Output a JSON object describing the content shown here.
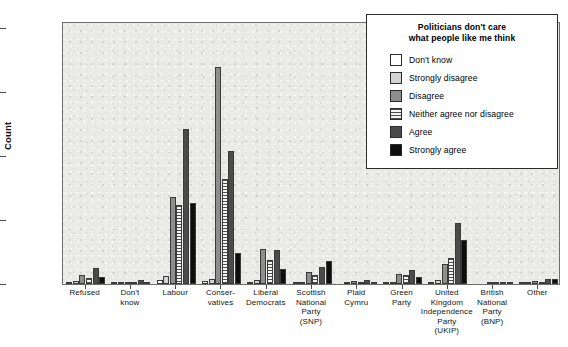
{
  "chart_data": {
    "type": "bar",
    "title": "",
    "xlabel": "",
    "ylabel": "Count",
    "ylim": [
      0,
      430
    ],
    "yticks": [
      0,
      100,
      200,
      300,
      400
    ],
    "grid": false,
    "legend_position": "top-right",
    "legend_title": "Politicians don't care what people like me think",
    "categories": [
      "Refused",
      "Don't know",
      "Labour",
      "Conservatives",
      "Liberal Democrats",
      "Scottish National Party (SNP)",
      "Plaid Cymru",
      "Green Party",
      "United Kingdom Independence Party (UKIP)",
      "British National Party (BNP)",
      "Other"
    ],
    "series": [
      {
        "name": "Don't know",
        "color": "#ffffff",
        "values": [
          4,
          1,
          7,
          5,
          2,
          1,
          0,
          1,
          3,
          0,
          1
        ]
      },
      {
        "name": "Strongly disagree",
        "color": "#d2d2d2",
        "values": [
          5,
          2,
          13,
          9,
          6,
          3,
          1,
          3,
          6,
          0,
          2
        ]
      },
      {
        "name": "Disagree",
        "color": "#8e8e8e",
        "values": [
          15,
          4,
          143,
          355,
          57,
          19,
          5,
          17,
          33,
          1,
          5
        ]
      },
      {
        "name": "Neither agree nor disagree",
        "color": "#f2f2f2",
        "values": [
          10,
          3,
          130,
          172,
          40,
          14,
          4,
          14,
          42,
          1,
          4
        ]
      },
      {
        "name": "Agree",
        "color": "#4b4b4b",
        "values": [
          27,
          6,
          253,
          217,
          55,
          28,
          7,
          23,
          100,
          2,
          9
        ]
      },
      {
        "name": "Strongly agree",
        "color": "#0e0e0e",
        "values": [
          12,
          3,
          132,
          50,
          24,
          38,
          4,
          12,
          72,
          2,
          9
        ]
      }
    ]
  },
  "axis": {
    "y_title": "Count",
    "y_tick_labels": [
      "400",
      "300",
      "200",
      "100",
      "0"
    ],
    "x_tick_labels": [
      [
        "Refused"
      ],
      [
        "Don't",
        "know"
      ],
      [
        "Labour"
      ],
      [
        "Conser-",
        "vatives"
      ],
      [
        "Liberal",
        "Democrats"
      ],
      [
        "Scottish",
        "National",
        "Party",
        "(SNP)"
      ],
      [
        "Plaid",
        "Cymru"
      ],
      [
        "Green",
        "Party"
      ],
      [
        "United",
        "Kingdom",
        "Independence",
        "Party",
        "(UKIP)"
      ],
      [
        "British",
        "National",
        "Party",
        "(BNP)"
      ],
      [
        "Other"
      ]
    ]
  },
  "legend": {
    "title_line1": "Politicians don't care",
    "title_line2": "what people like me think",
    "items": [
      {
        "label": "Don't know",
        "swatch": "swatch-white"
      },
      {
        "label": "Strongly disagree",
        "swatch": "swatch-light-grey"
      },
      {
        "label": "Disagree",
        "swatch": "swatch-mid-grey"
      },
      {
        "label": "Neither agree nor disagree",
        "swatch": "swatch-horizontal-hatch"
      },
      {
        "label": "Agree",
        "swatch": "swatch-dark-grey"
      },
      {
        "label": "Strongly agree",
        "swatch": "swatch-black"
      }
    ]
  },
  "colors": {
    "plot_background": "#e9e9e7",
    "frame": "#6d6d6d",
    "bar_outline": "#3a3a3a",
    "text": "#111111"
  }
}
